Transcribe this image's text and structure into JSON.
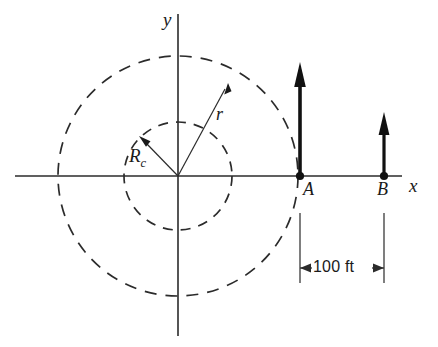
{
  "figure": {
    "background": "#ffffff",
    "stroke_color": "#2b2b2b",
    "axes": {
      "x_label": "x",
      "y_label": "y",
      "origin": [
        178,
        176
      ],
      "x_extent": [
        15,
        400
      ],
      "y_extent": [
        14,
        335
      ]
    },
    "circles": [
      {
        "name": "inner-dashed-circle",
        "label": "R_c",
        "radius": 54,
        "style": "dashed"
      },
      {
        "name": "outer-dashed-circle",
        "label": "r",
        "radius": 120,
        "style": "dashed"
      }
    ],
    "radial_lines": [
      {
        "name": "radius-Rc-line",
        "label": "R_c",
        "angle_deg": 124,
        "arrow": true
      },
      {
        "name": "radius-r-line",
        "label": "r",
        "angle_deg": 56,
        "arrow": true
      }
    ],
    "labels": {
      "radius_r": "r",
      "radius_rc": "R",
      "radius_rc_sub": "c"
    },
    "points": [
      {
        "name": "point-a",
        "label": "A",
        "x": 300,
        "y": 176,
        "arrow_height": 113
      },
      {
        "name": "point-b",
        "label": "B",
        "x": 384,
        "y": 176,
        "arrow_height": 63
      }
    ],
    "dimension": {
      "text": "100 ft",
      "from_x": 300,
      "to_x": 384,
      "y": 270
    }
  }
}
